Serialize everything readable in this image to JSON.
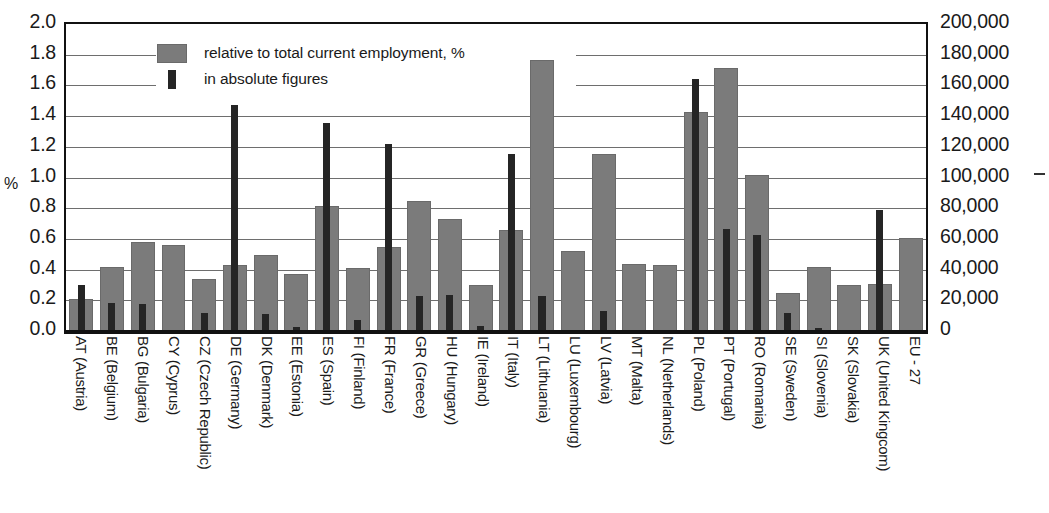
{
  "axes": {
    "left_title": "%",
    "left_ticks": [
      "2.0",
      "1.8",
      "1.6",
      "1.4",
      "1.2",
      "1.0",
      "0.8",
      "0.6",
      "0.4",
      "0.2",
      "0.0"
    ],
    "right_ticks": [
      "200,000",
      "180,000",
      "160,000",
      "140,000",
      "120,000",
      "100,000",
      "80,000",
      "60,000",
      "40,000",
      "20,000",
      "0"
    ]
  },
  "legend": {
    "items": [
      {
        "label": "relative to total current employment, %",
        "color": "#7b7b7b",
        "marker": "square"
      },
      {
        "label": "in absolute figures",
        "color": "#252525",
        "marker": "bar"
      }
    ]
  },
  "chart_data": {
    "type": "bar",
    "title": "",
    "xlabel": "",
    "ylabel": "%",
    "ylim": [
      0,
      2.0
    ],
    "y2lim": [
      0,
      200000
    ],
    "ytick_step": 0.2,
    "y2tick_step": 20000,
    "grid": true,
    "legend_position": "top-left-inside",
    "categories": [
      "AT (Austria)",
      "BE (Belgium)",
      "BG (Bulgaria)",
      "CY (Cyprus)",
      "CZ (Czech Republic)",
      "DE (Germany)",
      "DK (Denmark)",
      "EE (Estonia)",
      "ES (Spain)",
      "FI (Finland)",
      "FR (France)",
      "GR (Greece)",
      "HU (Hungary)",
      "IE (Ireland)",
      "IT (Italy)",
      "LT (Lithuania)",
      "LU (Luxembourg)",
      "LV (Latvia)",
      "MT (Malta)",
      "NL (Netherlands)",
      "PL (Poland)",
      "PT (Portugal)",
      "RO (Romania)",
      "SE (Sweden)",
      "SI (Slovenia)",
      "SK (Slovakia)",
      "UK (United Kingcom)",
      "EU - 27"
    ],
    "series": [
      {
        "name": "relative to total current employment, %",
        "axis": "left",
        "unit": "%",
        "color": "#7b7b7b",
        "values": [
          0.21,
          0.42,
          0.58,
          0.56,
          0.34,
          0.43,
          0.5,
          0.37,
          0.82,
          0.41,
          0.55,
          0.85,
          0.73,
          0.3,
          0.66,
          1.77,
          0.52,
          1.16,
          0.44,
          0.43,
          1.43,
          1.72,
          1.02,
          0.25,
          0.42,
          0.3,
          0.31,
          0.61
        ]
      },
      {
        "name": "in absolute figures",
        "axis": "right",
        "unit": "persons",
        "color": "#252525",
        "values": [
          30000,
          18000,
          17500,
          0,
          12000,
          148000,
          11000,
          2500,
          136000,
          7500,
          122000,
          23000,
          23500,
          3000,
          116000,
          23000,
          0,
          13000,
          0,
          0,
          165000,
          66500,
          63000,
          12000,
          2000,
          0,
          79000,
          0
        ]
      }
    ]
  }
}
